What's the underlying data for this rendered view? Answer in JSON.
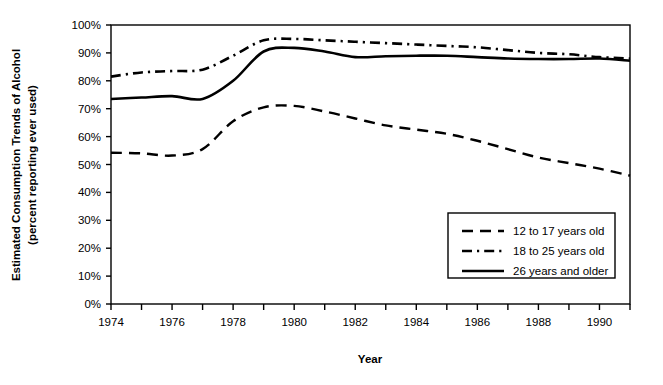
{
  "chart_data": {
    "type": "line",
    "title": "",
    "xlabel": "Year",
    "ylabel": "Estimated Consumption Trends of Alcohol (percent reporting ever used)",
    "ylabel_line1": "Estimated Consumption Trends of Alcohol",
    "ylabel_line2": "(percent reporting ever used)",
    "xlim": [
      1974,
      1991
    ],
    "ylim": [
      0,
      100
    ],
    "y_ticks": [
      0,
      10,
      20,
      30,
      40,
      50,
      60,
      70,
      80,
      90,
      100
    ],
    "y_tick_labels": [
      "0%",
      "10%",
      "20%",
      "30%",
      "40%",
      "50%",
      "60%",
      "70%",
      "80%",
      "90%",
      "100%"
    ],
    "x_ticks": [
      1974,
      1975,
      1976,
      1977,
      1978,
      1979,
      1980,
      1981,
      1982,
      1983,
      1984,
      1985,
      1986,
      1987,
      1988,
      1989,
      1990,
      1991
    ],
    "x_tick_labels": [
      "1974",
      "",
      "1976",
      "",
      "1978",
      "",
      "1980",
      "",
      "1982",
      "",
      "1984",
      "",
      "1986",
      "",
      "1988",
      "",
      "1990",
      ""
    ],
    "x_labeled_years": [
      1974,
      1976,
      1978,
      1980,
      1982,
      1984,
      1986,
      1988,
      1990
    ],
    "grid": false,
    "legend_position": "lower right",
    "x": [
      1974,
      1975,
      1976,
      1977,
      1978,
      1979,
      1980,
      1981,
      1982,
      1983,
      1984,
      1985,
      1986,
      1987,
      1988,
      1989,
      1990,
      1991
    ],
    "series": [
      {
        "name": "12 to 17 years old",
        "style": "dashed",
        "values": [
          54.2,
          54.0,
          53.2,
          55.5,
          65.5,
          70.5,
          71.0,
          69.0,
          66.5,
          64.0,
          62.5,
          61.0,
          58.5,
          55.5,
          52.5,
          50.5,
          48.5,
          46.0
        ]
      },
      {
        "name": "18 to 25 years old",
        "style": "dash-dot",
        "values": [
          81.5,
          83.0,
          83.5,
          84.0,
          89.0,
          94.5,
          95.0,
          94.5,
          94.0,
          93.5,
          93.0,
          92.5,
          92.0,
          91.0,
          90.0,
          89.5,
          88.5,
          88.0
        ]
      },
      {
        "name": "26 years and older",
        "style": "solid",
        "values": [
          73.5,
          74.0,
          74.5,
          73.5,
          80.0,
          90.5,
          91.8,
          90.5,
          88.5,
          88.8,
          89.0,
          89.0,
          88.5,
          88.0,
          87.8,
          87.8,
          88.0,
          87.2
        ]
      }
    ]
  },
  "legend": {
    "items": [
      {
        "label": "12 to 17 years old",
        "style": "dashed"
      },
      {
        "label": "18 to 25 years old",
        "style": "dash-dot"
      },
      {
        "label": "26 years and older",
        "style": "solid"
      }
    ]
  }
}
